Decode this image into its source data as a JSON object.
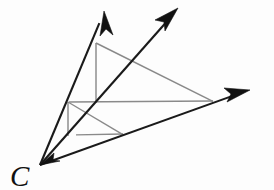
{
  "figure": {
    "type": "geometry-diagram",
    "canvas": {
      "width": 274,
      "height": 190
    },
    "background_color": "#fdfdfd",
    "ray_color": "#1a1a1a",
    "inner_line_color": "#8a8a8a",
    "label_color": "#111111"
  },
  "labels": {
    "vertex_c": "C"
  },
  "points": {
    "C": {
      "x": 40,
      "y": 165
    },
    "left_ray_tip": {
      "x": 104,
      "y": 12
    },
    "middle_ray_tip": {
      "x": 177,
      "y": 10
    },
    "right_ray_tip": {
      "x": 249,
      "y": 90
    },
    "big_top": {
      "x": 96,
      "y": 43
    },
    "big_mid": {
      "x": 96,
      "y": 102
    },
    "big_right": {
      "x": 212,
      "y": 101
    },
    "big_left_on_ray": {
      "x": 68,
      "y": 102
    },
    "small_top": {
      "x": 68,
      "y": 102
    },
    "small_mid": {
      "x": 68,
      "y": 135
    },
    "small_right": {
      "x": 122,
      "y": 134
    }
  },
  "rays": [
    {
      "name": "ray-left",
      "from": "C",
      "to": "left_ray_tip"
    },
    {
      "name": "ray-middle",
      "from": "C",
      "to": "middle_ray_tip"
    },
    {
      "name": "ray-right",
      "from": "C",
      "to": "right_ray_tip"
    }
  ],
  "inner_segments": [
    {
      "name": "large-triangle-hypotenuse",
      "from": "big_top",
      "to": "big_right"
    },
    {
      "name": "large-triangle-vertical",
      "from": "big_top",
      "to": "big_mid"
    },
    {
      "name": "large-triangle-horizontal",
      "from": "big_left_on_ray",
      "to": "big_right"
    },
    {
      "name": "small-triangle-hypotenuse",
      "from": "small_top",
      "to": "small_right"
    },
    {
      "name": "small-triangle-vertical",
      "from": "small_top",
      "to": "small_mid"
    },
    {
      "name": "small-triangle-horizontal",
      "from": "small_mid",
      "to": "small_right"
    }
  ],
  "label_position": {
    "x": 10,
    "y": 186
  }
}
